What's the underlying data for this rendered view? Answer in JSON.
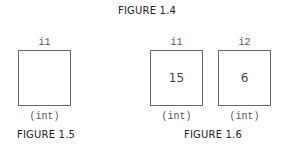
{
  "figure_1_4": {
    "caption": "FIGURE 1.4"
  },
  "figure_1_5": {
    "caption": "FIGURE 1.5",
    "variables": [
      {
        "name": "i1",
        "value": "",
        "type": "(int)"
      }
    ]
  },
  "figure_1_6": {
    "caption": "FIGURE 1.6",
    "variables": [
      {
        "name": "i1",
        "value": "15",
        "type": "(int)"
      },
      {
        "name": "i2",
        "value": "6",
        "type": "(int)"
      }
    ]
  }
}
